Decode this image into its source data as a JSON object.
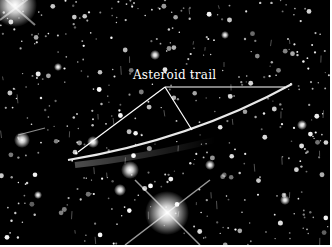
{
  "image": {
    "subject": "star field with asteroid trail",
    "background_color": "#000000"
  },
  "annotation": {
    "label": "Asteroid trail",
    "line_color": "#ffffff"
  }
}
